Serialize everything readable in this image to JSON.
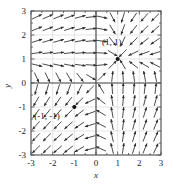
{
  "chart_data": {
    "type": "scatter",
    "subtype": "vector-field",
    "title": "",
    "xlabel": "x",
    "ylabel": "y",
    "xlim": [
      -3,
      3
    ],
    "ylim": [
      -3,
      3
    ],
    "grid": true,
    "legend": "none",
    "xticks": [
      -3,
      -2,
      -1,
      0,
      1,
      2,
      3
    ],
    "yticks": [
      -3,
      -2,
      -1,
      0,
      1,
      2,
      3
    ],
    "xtick_labels": [
      "-3",
      "-2",
      "-1",
      "0",
      "1",
      "2",
      "3"
    ],
    "ytick_labels": [
      "-3",
      "-2",
      "-1",
      "0",
      "1",
      "2",
      "3"
    ],
    "annotations": [
      {
        "text": "(1, 1)",
        "x": 1,
        "y": 1,
        "dx": -6,
        "dy": -14
      },
      {
        "text": "(-1, -1)",
        "x": -1,
        "y": -1,
        "dx": -40,
        "dy": 12
      }
    ],
    "points": [
      {
        "x": 1,
        "y": 1,
        "marker": "filled-circle"
      },
      {
        "x": -1,
        "y": -1,
        "marker": "filled-circle"
      }
    ],
    "vector_grid": {
      "x_start": -2.75,
      "x_step": 0.5,
      "x_count": 12,
      "y_start": -2.75,
      "y_step": 0.5,
      "y_count": 12,
      "field_u": "y - x*y",
      "field_v": "x - x*y",
      "arrow_length_px": 11,
      "normalized": true
    }
  },
  "colors": {
    "axis": "#3a3a3a",
    "grid": "#d8d8d8",
    "arrow": "#2b2b2b",
    "point": "#111111",
    "background": "#ffffff",
    "frame": "#4a4a4a"
  }
}
